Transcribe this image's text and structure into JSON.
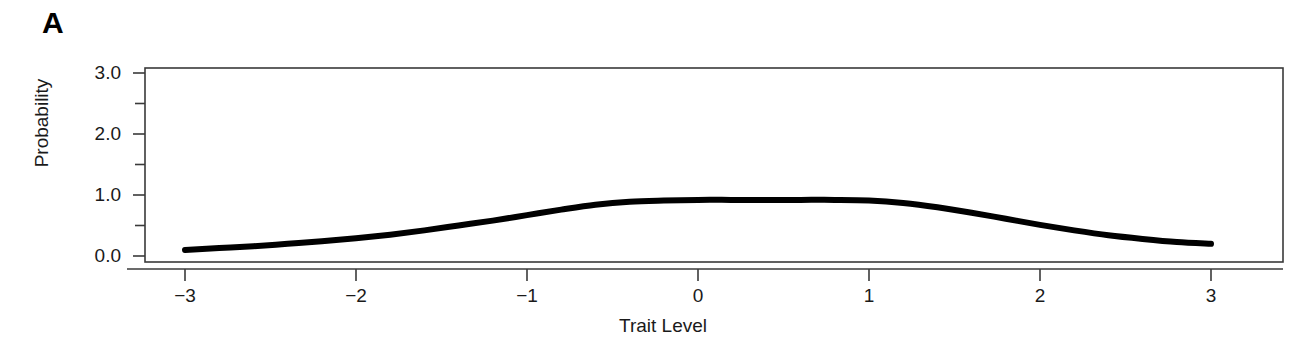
{
  "panel": {
    "label": "A"
  },
  "chart_data": {
    "type": "line",
    "title": "",
    "subtitle": "",
    "xlabel": "Trait Level",
    "ylabel": "Probability",
    "xlim": [
      -3.35,
      3.42
    ],
    "ylim": [
      0.0,
      3.18
    ],
    "grid": false,
    "legend": null,
    "xticks": [
      -3,
      -2,
      -1,
      0,
      1,
      2,
      3
    ],
    "xtick_labels": [
      "−3",
      "−2",
      "−1",
      "0",
      "1",
      "2",
      "3"
    ],
    "yticks": [
      0.0,
      0.5,
      1.0,
      1.5,
      2.0,
      2.5,
      3.0
    ],
    "ytick_labels": [
      "0.0",
      "",
      "1.0",
      "",
      "2.0",
      "",
      "3.0"
    ],
    "ytick_major_labels": [
      "0.0",
      "1.0",
      "2.0",
      "3.0"
    ],
    "line_color": "#000000",
    "line_width": 6,
    "series": [
      {
        "name": "Test Information / Probability Curve",
        "x": [
          -3.0,
          -2.8,
          -2.6,
          -2.4,
          -2.2,
          -2.0,
          -1.8,
          -1.6,
          -1.4,
          -1.2,
          -1.0,
          -0.8,
          -0.6,
          -0.4,
          -0.2,
          0.0,
          0.2,
          0.4,
          0.6,
          0.8,
          1.0,
          1.2,
          1.4,
          1.6,
          1.8,
          2.0,
          2.2,
          2.4,
          2.6,
          2.8,
          3.0
        ],
        "y": [
          0.1,
          0.13,
          0.16,
          0.2,
          0.24,
          0.29,
          0.35,
          0.42,
          0.5,
          0.58,
          0.67,
          0.76,
          0.84,
          0.89,
          0.91,
          0.92,
          0.92,
          0.92,
          0.92,
          0.92,
          0.91,
          0.87,
          0.8,
          0.71,
          0.61,
          0.51,
          0.42,
          0.34,
          0.28,
          0.23,
          0.2
        ]
      }
    ]
  }
}
